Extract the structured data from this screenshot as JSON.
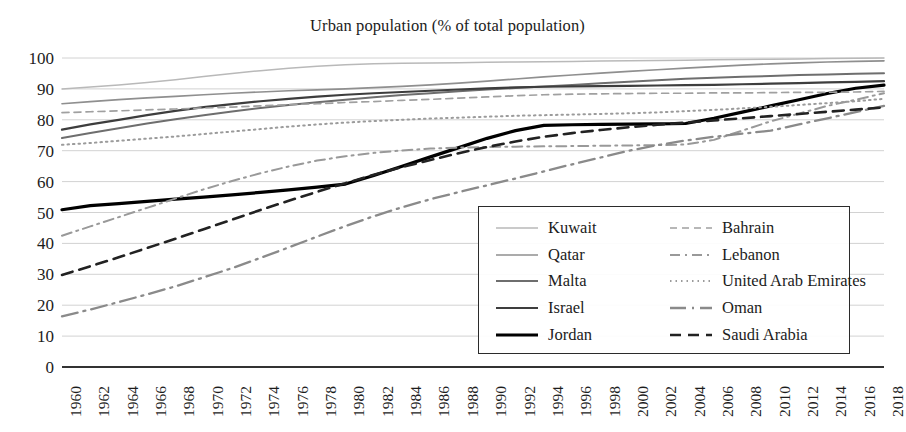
{
  "chart_data": {
    "type": "line",
    "title": "Urban population (% of total population)",
    "xlabel": "",
    "ylabel": "",
    "ylim": [
      0,
      100
    ],
    "ytick_step": 10,
    "yticks": [
      "0",
      "10",
      "20",
      "30",
      "40",
      "50",
      "60",
      "70",
      "80",
      "90",
      "100"
    ],
    "grid": "horizontal",
    "legend_position": "inside-bottom-right",
    "x": [
      1960,
      1962,
      1964,
      1966,
      1968,
      1970,
      1972,
      1974,
      1976,
      1978,
      1980,
      1982,
      1984,
      1986,
      1988,
      1990,
      1992,
      1994,
      1996,
      1998,
      2000,
      2002,
      2004,
      2006,
      2008,
      2010,
      2012,
      2014,
      2016,
      2018
    ],
    "xtick_labels": [
      "1960",
      "1962",
      "1964",
      "1966",
      "1968",
      "1970",
      "1972",
      "1974",
      "1976",
      "1978",
      "1980",
      "1982",
      "1984",
      "1986",
      "1988",
      "1990",
      "1992",
      "1994",
      "1996",
      "1998",
      "2000",
      "2002",
      "2004",
      "2006",
      "2008",
      "2010",
      "2012",
      "2014",
      "2016",
      "2018"
    ],
    "series": [
      {
        "name": "Kuwait",
        "style": "solid",
        "color": "#b9b9b9",
        "width": 1.5,
        "values": [
          90.0,
          90.6,
          91.3,
          92.1,
          93.0,
          94.0,
          95.0,
          95.9,
          96.7,
          97.3,
          97.8,
          98.1,
          98.3,
          98.4,
          98.5,
          98.6,
          98.7,
          98.8,
          98.9,
          99.0,
          99.1,
          99.2,
          99.3,
          99.4,
          99.5,
          99.6,
          99.7,
          99.8,
          99.9,
          100.0
        ]
      },
      {
        "name": "Qatar",
        "style": "solid",
        "color": "#8f8f8f",
        "width": 1.7,
        "values": [
          85.2,
          85.9,
          86.5,
          87.1,
          87.6,
          88.1,
          88.6,
          89.0,
          89.4,
          89.7,
          90.0,
          90.4,
          90.8,
          91.3,
          91.9,
          92.5,
          93.2,
          93.9,
          94.5,
          95.1,
          95.7,
          96.2,
          96.7,
          97.2,
          97.7,
          98.1,
          98.4,
          98.7,
          98.9,
          99.1
        ]
      },
      {
        "name": "Malta",
        "style": "solid",
        "color": "#6e6e6e",
        "width": 2.0,
        "values": [
          74.1,
          75.7,
          77.3,
          78.8,
          80.2,
          81.5,
          82.7,
          83.8,
          84.8,
          85.7,
          86.5,
          87.3,
          88.0,
          88.6,
          89.2,
          89.8,
          90.3,
          90.8,
          91.3,
          91.8,
          92.3,
          92.8,
          93.3,
          93.6,
          93.9,
          94.2,
          94.5,
          94.7,
          94.9,
          95.1
        ]
      },
      {
        "name": "Israel",
        "style": "solid",
        "color": "#3d3d3d",
        "width": 2.2,
        "values": [
          76.8,
          78.5,
          80.0,
          81.5,
          82.9,
          84.1,
          85.1,
          86.0,
          86.8,
          87.5,
          88.1,
          88.6,
          89.0,
          89.4,
          89.8,
          90.2,
          90.5,
          90.7,
          90.8,
          90.9,
          91.0,
          91.1,
          91.2,
          91.3,
          91.5,
          91.7,
          91.9,
          92.1,
          92.3,
          92.5
        ]
      },
      {
        "name": "Jordan",
        "style": "solid",
        "color": "#000000",
        "width": 3.2,
        "values": [
          50.9,
          52.2,
          52.9,
          53.6,
          54.3,
          55.0,
          55.7,
          56.5,
          57.3,
          58.2,
          59.2,
          62.0,
          65.0,
          68.0,
          71.0,
          74.0,
          76.5,
          78.2,
          78.4,
          78.5,
          78.6,
          78.7,
          78.8,
          80.5,
          82.5,
          84.5,
          86.5,
          88.5,
          90.2,
          91.2
        ]
      },
      {
        "name": "Bahrain",
        "style": "dashed",
        "color": "#a0a0a0",
        "width": 1.7,
        "values": [
          82.3,
          82.6,
          82.9,
          83.2,
          83.5,
          83.8,
          84.1,
          84.5,
          84.9,
          85.2,
          85.6,
          85.9,
          86.3,
          86.6,
          87.0,
          87.4,
          87.8,
          88.1,
          88.3,
          88.4,
          88.5,
          88.6,
          88.6,
          88.7,
          88.7,
          88.8,
          88.9,
          88.9,
          89.0,
          89.2
        ]
      },
      {
        "name": "Lebanon",
        "style": "dashdot",
        "color": "#999999",
        "width": 2.0,
        "values": [
          42.5,
          45.5,
          48.5,
          51.5,
          54.5,
          57.5,
          60.2,
          62.7,
          64.9,
          66.8,
          68.2,
          69.3,
          70.1,
          70.7,
          71.0,
          71.2,
          71.3,
          71.4,
          71.5,
          71.6,
          71.7,
          71.8,
          72.0,
          73.5,
          76.5,
          79.5,
          82.0,
          84.5,
          86.5,
          88.6
        ]
      },
      {
        "name": "United Arab Emirates",
        "style": "dotted",
        "color": "#9b9b9b",
        "width": 2.0,
        "values": [
          71.9,
          72.5,
          73.2,
          73.9,
          74.6,
          75.4,
          76.2,
          77.0,
          77.8,
          78.5,
          79.1,
          79.6,
          80.0,
          80.4,
          80.7,
          81.0,
          81.3,
          81.5,
          81.7,
          81.9,
          82.1,
          82.4,
          82.8,
          83.2,
          83.7,
          84.2,
          84.8,
          85.4,
          86.0,
          86.8
        ]
      },
      {
        "name": "Oman",
        "style": "longdashdot",
        "color": "#8a8a8a",
        "width": 2.3,
        "values": [
          16.4,
          18.6,
          21.0,
          23.5,
          26.1,
          29.0,
          32.0,
          35.3,
          38.7,
          42.2,
          45.6,
          48.8,
          51.7,
          54.3,
          56.6,
          58.8,
          61.0,
          63.3,
          65.6,
          67.8,
          70.0,
          71.8,
          73.3,
          74.5,
          75.5,
          76.5,
          78.5,
          80.5,
          82.5,
          84.5
        ]
      },
      {
        "name": "Saudi Arabia",
        "style": "dashed-thick",
        "color": "#222222",
        "width": 2.6,
        "values": [
          29.8,
          32.6,
          35.5,
          38.5,
          41.5,
          44.6,
          47.7,
          50.8,
          53.8,
          56.7,
          59.5,
          62.2,
          64.7,
          67.0,
          69.2,
          71.2,
          73.0,
          74.5,
          75.7,
          76.7,
          77.6,
          78.4,
          79.1,
          79.8,
          80.5,
          81.2,
          81.9,
          82.6,
          83.3,
          84.0
        ]
      }
    ],
    "legend_columns": [
      [
        "Kuwait",
        "Qatar",
        "Malta",
        "Israel",
        "Jordan"
      ],
      [
        "Bahrain",
        "Lebanon",
        "United Arab Emirates",
        "Oman",
        "Saudi Arabia"
      ]
    ]
  }
}
